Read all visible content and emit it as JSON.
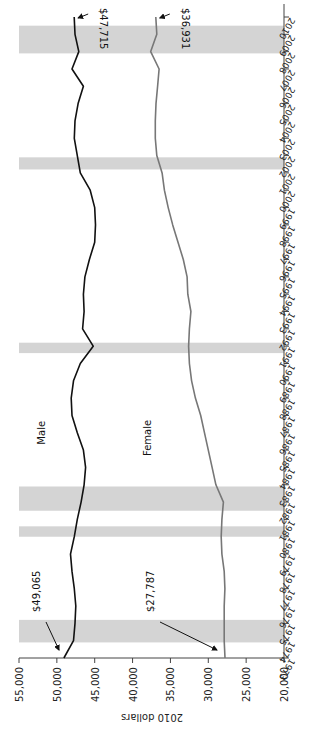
{
  "chart_data": {
    "type": "line",
    "title": "",
    "orientation": "rotated 90 degrees counter-clockwise",
    "xlabel": "",
    "ylabel": "2010 dollars",
    "ylim": [
      20000,
      55000
    ],
    "yticks": [
      "20,000",
      "25,000",
      "30,000",
      "35,000",
      "40,000",
      "45,000",
      "50,000",
      "55,000"
    ],
    "x": [
      1973,
      1974,
      1975,
      1976,
      1977,
      1978,
      1979,
      1980,
      1981,
      1982,
      1983,
      1984,
      1985,
      1986,
      1987,
      1988,
      1989,
      1990,
      1991,
      1992,
      1993,
      1994,
      1995,
      1996,
      1997,
      1998,
      1999,
      2000,
      2001,
      2002,
      2003,
      2004,
      2005,
      2006,
      2007,
      2008,
      2009,
      2010
    ],
    "xticks": [
      "1973",
      "1974",
      "1975",
      "1976",
      "1977",
      "1978",
      "1979",
      "1980",
      "1981",
      "1982",
      "1983",
      "1984",
      "1985",
      "1986",
      "1987",
      "1988",
      "1989",
      "1990",
      "1991",
      "1992",
      "1993",
      "1994",
      "1995",
      "1996",
      "1997",
      "1998",
      "1999",
      "2000",
      "2001",
      "2002",
      "2003",
      "2004",
      "2005",
      "2006",
      "2007",
      "2008",
      "2009",
      "2010"
    ],
    "grid": false,
    "recession_bands": [
      [
        1973.9,
        1975.2
      ],
      [
        1980.0,
        1980.6
      ],
      [
        1981.5,
        1982.9
      ],
      [
        1990.6,
        1991.2
      ],
      [
        2001.2,
        2001.9
      ],
      [
        2007.9,
        2009.5
      ]
    ],
    "series": [
      {
        "name": "Male",
        "color": "#111111",
        "values": [
          49065,
          47800,
          47600,
          47500,
          47700,
          48000,
          48200,
          47700,
          47300,
          46800,
          46400,
          46200,
          46500,
          47300,
          48000,
          48100,
          47800,
          46900,
          45200,
          46600,
          46400,
          46500,
          46300,
          45700,
          45000,
          44900,
          45000,
          45600,
          46900,
          47300,
          47700,
          47600,
          47200,
          46500,
          48000,
          47100,
          47600,
          47715
        ]
      },
      {
        "name": "Female",
        "color": "#777777",
        "values": [
          27787,
          27900,
          27900,
          27900,
          27800,
          27900,
          28200,
          28300,
          28200,
          28000,
          29000,
          29500,
          30000,
          30500,
          31000,
          31700,
          32200,
          32500,
          32600,
          32500,
          32300,
          32700,
          32800,
          33300,
          34000,
          34700,
          35300,
          35800,
          36100,
          36800,
          37000,
          37000,
          36900,
          36700,
          36500,
          37600,
          36800,
          36931
        ]
      }
    ],
    "annotations": [
      {
        "text": "$49,065",
        "target": "Male 1973"
      },
      {
        "text": "$27,787",
        "target": "Female 1973"
      },
      {
        "text": "$47,715",
        "target": "Male 2010"
      },
      {
        "text": "$36,931",
        "target": "Female 2010"
      }
    ],
    "series_labels": [
      {
        "text": "Male",
        "year": 1986,
        "value": 51500
      },
      {
        "text": "Female",
        "year": 1985.7,
        "value": 37500
      }
    ]
  }
}
